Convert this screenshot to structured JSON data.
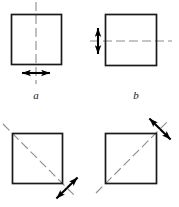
{
  "figure": {
    "kind": "symmetry-diagram",
    "background_color": "#ffffff",
    "line_color": "#1a1a1a",
    "centerline_color": "#8c8c8c",
    "arrow_color": "#000000",
    "panels": [
      {
        "id": "a",
        "label": "a",
        "label_style": "italic",
        "square": {
          "x": 11,
          "y": 14,
          "width": 51,
          "height": 51
        },
        "axis": {
          "type": "vertical",
          "x1": 36,
          "y1": 2,
          "x2": 36,
          "y2": 84
        },
        "arrow": {
          "type": "double-headed",
          "orientation": "horizontal",
          "cx": 36,
          "cy": 73,
          "half_length": 15
        }
      },
      {
        "id": "b",
        "label": "b",
        "label_style": "italic",
        "square": {
          "x": 105,
          "y": 14,
          "width": 52,
          "height": 52
        },
        "axis": {
          "type": "horizontal",
          "x1": 90,
          "y1": 41,
          "x2": 172,
          "y2": 41
        },
        "arrow": {
          "type": "double-headed",
          "orientation": "vertical",
          "cx": 98,
          "cy": 41,
          "half_length": 14
        }
      },
      {
        "id": "c",
        "label": "",
        "label_style": "italic",
        "square": {
          "x": 12,
          "y": 133,
          "width": 51,
          "height": 51
        },
        "axis": {
          "type": "diagonal-down",
          "x1": 3,
          "y1": 124,
          "x2": 76,
          "y2": 197
        },
        "arrow": {
          "type": "double-headed",
          "orientation": "anti-diagonal",
          "cx": 67,
          "cy": 188,
          "half_length": 15
        }
      },
      {
        "id": "d",
        "label": "",
        "label_style": "italic",
        "square": {
          "x": 105,
          "y": 133,
          "width": 52,
          "height": 51
        },
        "axis": {
          "type": "diagonal-up",
          "x1": 96,
          "y1": 193,
          "x2": 169,
          "y2": 120
        },
        "arrow": {
          "type": "double-headed",
          "orientation": "diagonal-down",
          "cx": 160,
          "cy": 129,
          "half_length": 15
        }
      }
    ],
    "labels": [
      {
        "text": "a",
        "x": 36,
        "y": 99
      },
      {
        "text": "b",
        "x": 136,
        "y": 99
      }
    ]
  }
}
